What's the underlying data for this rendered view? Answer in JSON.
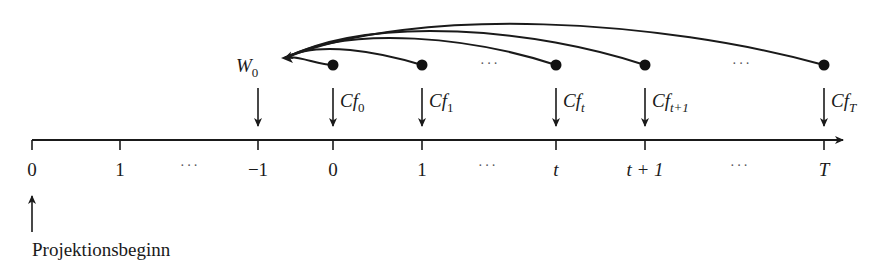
{
  "diagram": {
    "type": "cash-flow timeline",
    "colors": {
      "ink": "#1a1a1a",
      "background": "#ffffff"
    },
    "axis": {
      "direction": "right",
      "ticks": [
        {
          "x": 32,
          "label": "0",
          "italic": false
        },
        {
          "x": 120,
          "label": "1",
          "italic": false
        },
        {
          "x": 258,
          "label": "−1",
          "italic": false
        },
        {
          "x": 333,
          "label": "0",
          "italic": false
        },
        {
          "x": 422,
          "label": "1",
          "italic": false
        },
        {
          "x": 556,
          "label": "t",
          "italic": true
        },
        {
          "x": 645,
          "label": "t + 1",
          "italic": true
        },
        {
          "x": 824,
          "label": "T",
          "italic": true
        }
      ],
      "ellipses": [
        {
          "x": 190,
          "text": "···"
        },
        {
          "x": 488,
          "text": "···"
        },
        {
          "x": 740,
          "text": "···"
        }
      ]
    },
    "value_node": {
      "label": "W",
      "subscript": "0",
      "x": 258
    },
    "cash_flows": [
      {
        "x": 333,
        "label": "Cf",
        "subscript": "0"
      },
      {
        "x": 422,
        "label": "Cf",
        "subscript": "1"
      },
      {
        "x": 556,
        "label": "Cf",
        "subscript": "t"
      },
      {
        "x": 645,
        "label": "Cf",
        "subscript": "t+1"
      },
      {
        "x": 824,
        "label": "Cf",
        "subscript": "T"
      }
    ],
    "top_ellipses": [
      {
        "x": 490,
        "text": "···"
      },
      {
        "x": 742,
        "text": "···"
      }
    ],
    "start_marker": {
      "x": 32,
      "label": "Projektionsbeginn"
    }
  }
}
